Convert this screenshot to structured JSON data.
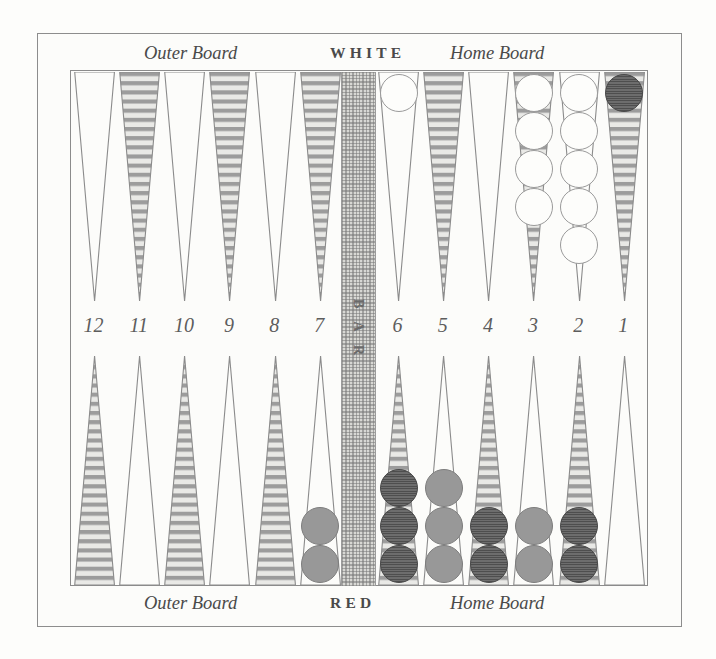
{
  "board": {
    "title": "Backgammon Board",
    "top_labels": {
      "outer_board": "Outer Board",
      "player": "WHITE",
      "home_board": "Home Board"
    },
    "bottom_labels": {
      "outer_board": "Outer Board",
      "player": "RED",
      "home_board": "Home Board"
    },
    "bar_label": "B A R",
    "point_numbers_left": [
      "12",
      "11",
      "10",
      "9",
      "8",
      "7"
    ],
    "point_numbers_right": [
      "6",
      "5",
      "4",
      "3",
      "2",
      "1"
    ],
    "colors": {
      "background": "#fdfdfb",
      "frame_line": "#8d8d8d",
      "point_shaded": "#9c9c9c",
      "point_plain": "#fcfcfa",
      "bar_fill": "#d8d8d4",
      "checker_white": "#fdfdfb",
      "checker_dark": "#5f5f5f",
      "checker_gray": "#989898",
      "text": "#4a4a4a"
    }
  },
  "points": {
    "top_left": [
      {
        "number": "12",
        "shaded": false,
        "checkers": 0,
        "color": ""
      },
      {
        "number": "11",
        "shaded": true,
        "checkers": 0,
        "color": ""
      },
      {
        "number": "10",
        "shaded": false,
        "checkers": 0,
        "color": ""
      },
      {
        "number": "9",
        "shaded": true,
        "checkers": 0,
        "color": ""
      },
      {
        "number": "8",
        "shaded": false,
        "checkers": 0,
        "color": ""
      },
      {
        "number": "7",
        "shaded": true,
        "checkers": 0,
        "color": ""
      }
    ],
    "top_right": [
      {
        "number": "6",
        "shaded": false,
        "checkers": 1,
        "color": "white"
      },
      {
        "number": "5",
        "shaded": true,
        "checkers": 0,
        "color": ""
      },
      {
        "number": "4",
        "shaded": false,
        "checkers": 0,
        "color": ""
      },
      {
        "number": "3",
        "shaded": true,
        "checkers": 4,
        "color": "white"
      },
      {
        "number": "2",
        "shaded": false,
        "checkers": 5,
        "color": "white"
      },
      {
        "number": "1",
        "shaded": true,
        "checkers": 1,
        "color": "dark"
      }
    ],
    "bottom_left": [
      {
        "number": "12",
        "shaded": true,
        "checkers": 0,
        "color": ""
      },
      {
        "number": "11",
        "shaded": false,
        "checkers": 0,
        "color": ""
      },
      {
        "number": "10",
        "shaded": true,
        "checkers": 0,
        "color": ""
      },
      {
        "number": "9",
        "shaded": false,
        "checkers": 0,
        "color": ""
      },
      {
        "number": "8",
        "shaded": true,
        "checkers": 0,
        "color": ""
      },
      {
        "number": "7",
        "shaded": false,
        "checkers": 2,
        "color": "gray"
      }
    ],
    "bottom_right": [
      {
        "number": "6",
        "shaded": true,
        "checkers": 3,
        "color": "dark"
      },
      {
        "number": "5",
        "shaded": false,
        "checkers": 3,
        "color": "gray"
      },
      {
        "number": "4",
        "shaded": true,
        "checkers": 2,
        "color": "dark"
      },
      {
        "number": "3",
        "shaded": false,
        "checkers": 2,
        "color": "gray"
      },
      {
        "number": "2",
        "shaded": true,
        "checkers": 2,
        "color": "dark"
      },
      {
        "number": "1",
        "shaded": false,
        "checkers": 0,
        "color": ""
      }
    ]
  }
}
